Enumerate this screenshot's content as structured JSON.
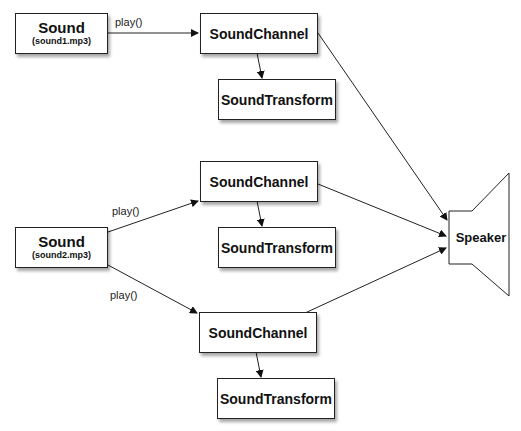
{
  "diagram": {
    "sounds": [
      {
        "title": "Sound",
        "file": "(sound1.mp3)"
      },
      {
        "title": "Sound",
        "file": "(sound2.mp3)"
      }
    ],
    "channels": [
      {
        "label": "SoundChannel",
        "transform": "SoundTransform"
      },
      {
        "label": "SoundChannel",
        "transform": "SoundTransform"
      },
      {
        "label": "SoundChannel",
        "transform": "SoundTransform"
      }
    ],
    "edge_labels": [
      "play()",
      "play()",
      "play()"
    ],
    "speaker": {
      "label": "Speaker"
    }
  }
}
